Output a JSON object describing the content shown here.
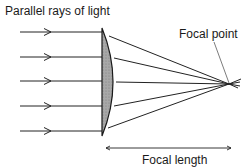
{
  "diagram": {
    "labels": {
      "parallel_rays": "Parallel rays of light",
      "focal_point": "Focal point",
      "focal_length": "Focal length"
    },
    "rays": {
      "count": 5,
      "y_positions": [
        32,
        57,
        81,
        106,
        131
      ]
    },
    "lens": {
      "type": "plano-convex",
      "fill": "#9a9a9a",
      "stroke": "#1a1a1a"
    },
    "focal_point_xy": [
      229,
      84
    ],
    "colors": {
      "line": "#222222",
      "text": "#1a1a1a"
    }
  }
}
